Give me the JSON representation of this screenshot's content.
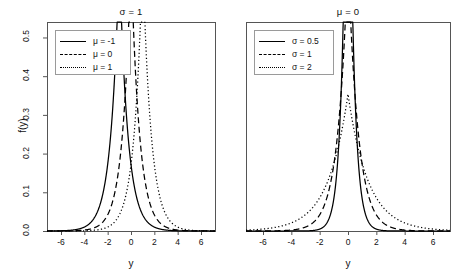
{
  "figure": {
    "width": 460,
    "height": 279,
    "background": "#ffffff",
    "line_color": "#000000",
    "axis_color": "#555555"
  },
  "axes": {
    "ylabel": "f(y)",
    "xlabel": "y",
    "xticks": [
      -6,
      -4,
      -2,
      0,
      2,
      4,
      6
    ],
    "xtick_labels": [
      "-6",
      "-4",
      "-2",
      "0",
      "2",
      "4",
      "6"
    ],
    "yticks": [
      0.0,
      0.1,
      0.2,
      0.3,
      0.4,
      0.5
    ],
    "ytick_labels": [
      "0.0",
      "0.1",
      "0.2",
      "0.3",
      "0.4",
      "0.5"
    ],
    "xlim": [
      -7.2,
      7.2
    ],
    "ylim": [
      0.0,
      0.54
    ]
  },
  "chart_data": [
    {
      "type": "line",
      "title": "σ = 1",
      "xlabel": "y",
      "ylabel": "f(y)",
      "xlim": [
        -7.2,
        7.2
      ],
      "ylim": [
        0.0,
        0.54
      ],
      "grid": false,
      "legend_position": "top-left",
      "distribution": "laplace",
      "series": [
        {
          "name": "μ = -1",
          "style": "solid",
          "mu": -1,
          "sigma": 1,
          "peak": 0.25
        },
        {
          "name": "μ = 0",
          "style": "dashed",
          "mu": 0,
          "sigma": 1,
          "peak": 0.25
        },
        {
          "name": "μ = 1",
          "style": "dotted",
          "mu": 1,
          "sigma": 1,
          "peak": 0.25
        }
      ]
    },
    {
      "type": "line",
      "title": "μ = 0",
      "xlabel": "y",
      "ylabel": "f(y)",
      "xlim": [
        -7.2,
        7.2
      ],
      "ylim": [
        0.0,
        0.54
      ],
      "grid": false,
      "legend_position": "top-left",
      "distribution": "laplace",
      "series": [
        {
          "name": "σ = 0.5",
          "style": "solid",
          "mu": 0,
          "sigma": 0.5,
          "peak": 0.5
        },
        {
          "name": "σ = 1",
          "style": "dashed",
          "mu": 0,
          "sigma": 1,
          "peak": 0.25
        },
        {
          "name": "σ = 2",
          "style": "dotted",
          "mu": 0,
          "sigma": 2,
          "peak": 0.125
        }
      ]
    }
  ],
  "panels": [
    {
      "id": "left",
      "title": "σ = 1",
      "legend": [
        {
          "label": "μ = -1",
          "style": "solid"
        },
        {
          "label": "μ = 0",
          "style": "dashed"
        },
        {
          "label": "μ = 1",
          "style": "dotted"
        }
      ]
    },
    {
      "id": "right",
      "title": "μ = 0",
      "legend": [
        {
          "label": "σ = 0.5",
          "style": "solid"
        },
        {
          "label": "σ = 1",
          "style": "dashed"
        },
        {
          "label": "σ = 2",
          "style": "dotted"
        }
      ]
    }
  ]
}
